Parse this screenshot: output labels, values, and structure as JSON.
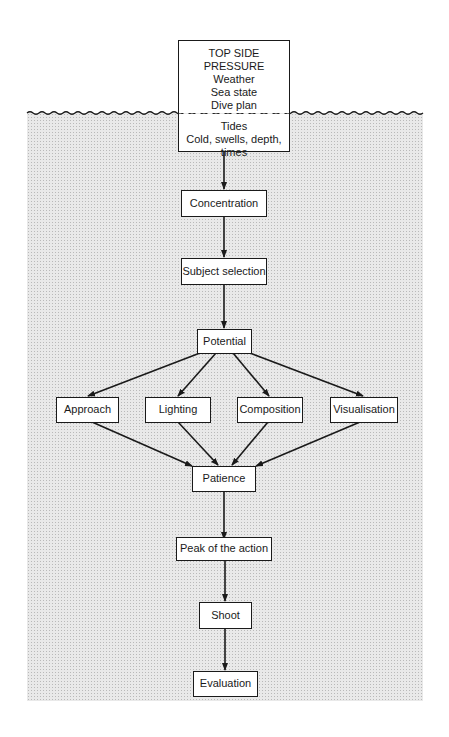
{
  "diagram": {
    "type": "flowchart",
    "top_box": {
      "title": "TOP SIDE PRESSURE",
      "above_surface": [
        "Weather",
        "Sea state",
        "Dive plan",
        "Photo kit"
      ],
      "below_surface": [
        "Tides",
        "Cold, swells, depth, times"
      ]
    },
    "nodes": {
      "concentration": "Concentration",
      "subject_selection": "Subject selection",
      "potential": "Potential",
      "approach": "Approach",
      "lighting": "Lighting",
      "composition": "Composition",
      "visualisation": "Visualisation",
      "patience": "Patience",
      "peak": "Peak of the action",
      "shoot": "Shoot",
      "evaluation": "Evaluation"
    },
    "edges": [
      [
        "top_box",
        "concentration"
      ],
      [
        "concentration",
        "subject_selection"
      ],
      [
        "subject_selection",
        "potential"
      ],
      [
        "potential",
        "approach"
      ],
      [
        "potential",
        "lighting"
      ],
      [
        "potential",
        "composition"
      ],
      [
        "potential",
        "visualisation"
      ],
      [
        "approach",
        "patience"
      ],
      [
        "lighting",
        "patience"
      ],
      [
        "composition",
        "patience"
      ],
      [
        "visualisation",
        "patience"
      ],
      [
        "patience",
        "peak"
      ],
      [
        "peak",
        "shoot"
      ],
      [
        "shoot",
        "evaluation"
      ]
    ],
    "colors": {
      "line": "#1a1a1a",
      "sea_fill": "#e9e9e9",
      "box_fill": "#ffffff"
    }
  }
}
